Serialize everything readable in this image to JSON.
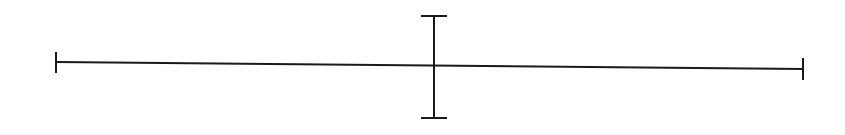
{
  "diagram": {
    "width": 845,
    "height": 135,
    "stroke_color": "#1a1a1a",
    "stroke_width": 2,
    "horizontal_segment": {
      "x1": 56,
      "y1": 62,
      "x2": 803,
      "y2": 69,
      "left_tick": {
        "x": 56,
        "y1": 52,
        "y2": 73
      },
      "right_tick": {
        "x": 803,
        "y1": 58,
        "y2": 80
      }
    },
    "vertical_segment": {
      "x": 434,
      "y1": 16,
      "y2": 118,
      "top_cap": {
        "x1": 421,
        "x2": 447,
        "y": 16
      },
      "bottom_cap": {
        "x1": 421,
        "x2": 447,
        "y": 118
      }
    }
  }
}
